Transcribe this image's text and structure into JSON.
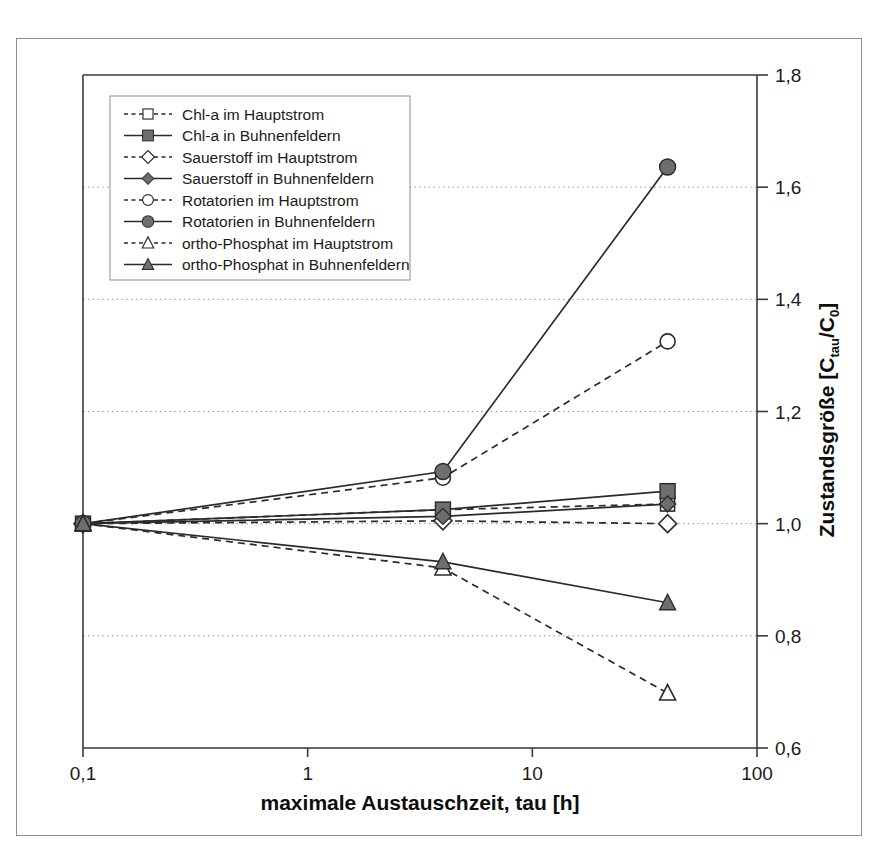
{
  "chart_data": {
    "type": "line",
    "title": "",
    "xlabel": "maximale Austauschzeit, tau [h]",
    "ylabel": "Zustandsgröße [Ctau/C0]",
    "ylabel_parts": {
      "main": "Zustandsgröße [C",
      "sub1": "tau",
      "mid": "/C",
      "sub2": "0",
      "end": "]"
    },
    "x_scale": "log",
    "xlim": [
      0.1,
      100
    ],
    "ylim": [
      0.6,
      1.8
    ],
    "x_ticklabels": [
      "0,1",
      "1",
      "10",
      "100"
    ],
    "x_tickvalues": [
      0.1,
      1,
      10,
      100
    ],
    "y_ticklabels": [
      "1,8",
      "1,6",
      "1,4",
      "1,2",
      "1,0",
      "0,8",
      "0,6"
    ],
    "y_tickvalues": [
      1.8,
      1.6,
      1.4,
      1.2,
      1.0,
      0.8,
      0.6
    ],
    "y_axis_position": "right",
    "grid": "horizontal-dotted",
    "legend_position": "upper-left-inside",
    "x": [
      0.1,
      4,
      40
    ],
    "series": [
      {
        "name": "Chl-a im Hauptstrom",
        "values": [
          1.0,
          1.025,
          1.035
        ],
        "marker": "square-open",
        "line": "dashed",
        "color": "#333333"
      },
      {
        "name": "Chl-a in Buhnenfeldern",
        "values": [
          1.0,
          1.025,
          1.058
        ],
        "marker": "square-filled",
        "line": "solid",
        "color": "#333333"
      },
      {
        "name": "Sauerstoff im Hauptstrom",
        "values": [
          1.0,
          1.005,
          1.0
        ],
        "marker": "diamond-open",
        "line": "dashed",
        "color": "#333333"
      },
      {
        "name": "Sauerstoff in Buhnenfeldern",
        "values": [
          1.0,
          1.013,
          1.035
        ],
        "marker": "diamond-filled",
        "line": "solid",
        "color": "#333333"
      },
      {
        "name": "Rotatorien im Hauptstrom",
        "values": [
          1.0,
          1.082,
          1.325
        ],
        "marker": "circle-open",
        "line": "dashed",
        "color": "#333333"
      },
      {
        "name": "Rotatorien in Buhnenfeldern",
        "values": [
          1.0,
          1.093,
          1.636
        ],
        "marker": "circle-filled",
        "line": "solid",
        "color": "#333333"
      },
      {
        "name": "ortho-Phosphat im Hauptstrom",
        "values": [
          1.0,
          0.921,
          0.698
        ],
        "marker": "triangle-open",
        "line": "dashed",
        "color": "#333333"
      },
      {
        "name": "ortho-Phosphat in Buhnenfeldern",
        "values": [
          1.0,
          0.932,
          0.859
        ],
        "marker": "triangle-filled",
        "line": "solid",
        "color": "#333333"
      }
    ]
  },
  "colors": {
    "frame": "#8d8d8d",
    "axis": "#3a3a3a",
    "grid": "#9a9a9a",
    "line": "#2b2b2b",
    "marker_fill": "#6e6e6e",
    "marker_open": "#ffffff",
    "text": "#1a1a1a"
  }
}
